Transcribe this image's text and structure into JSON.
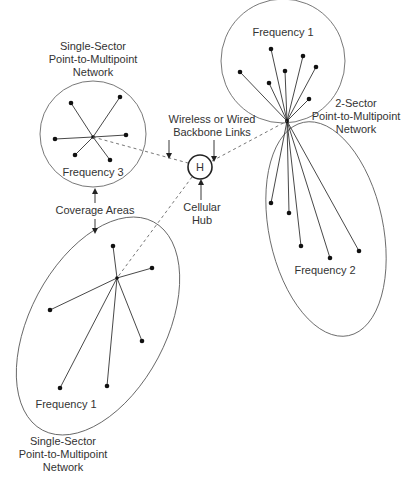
{
  "diagram": {
    "colors": {
      "line": "#333333",
      "node": "#111111",
      "background": "#ffffff"
    },
    "hub": {
      "symbol": "H",
      "label_line1": "Cellular",
      "label_line2": "Hub"
    },
    "callouts": {
      "backbone_line1": "Wireless or Wired",
      "backbone_line2": "Backbone Links",
      "coverage": "Coverage Areas"
    },
    "networks": [
      {
        "id": "single-sector-top",
        "title_line1": "Single-Sector",
        "title_line2": "Point-to-Multipoint",
        "title_line3": "Network",
        "frequency": "Frequency 3",
        "node_count": 6
      },
      {
        "id": "two-sector-right",
        "title_line1": "2-Sector",
        "title_line2": "Point-to-Multipoint",
        "title_line3": "Network",
        "sectors": [
          {
            "frequency": "Frequency 1",
            "node_count": 7
          },
          {
            "frequency": "Frequency 2",
            "node_count": 5
          }
        ]
      },
      {
        "id": "single-sector-bottom",
        "title_line1": "Single-Sector",
        "title_line2": "Point-to-Multipoint",
        "title_line3": "Network",
        "frequency": "Frequency 1",
        "node_count": 6
      }
    ]
  }
}
